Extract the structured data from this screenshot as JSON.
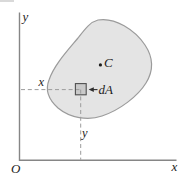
{
  "figure": {
    "axes": {
      "origin_label": "O",
      "x_axis_label": "x",
      "y_axis_label": "y"
    },
    "region": {
      "centroid_label": "C"
    },
    "element": {
      "label": "dA",
      "x_coordinate_label": "x",
      "y_coordinate_label": "y"
    }
  },
  "colors": {
    "region_fill": "#e4e4e4",
    "region_stroke": "#9b9b9b",
    "element_fill": "#c9c9c9",
    "element_stroke": "#4f4f4f",
    "axis_stroke": "#868686",
    "dash_stroke": "#9c9c9c",
    "arrow": "#2f2f2f",
    "artifact": "#d9d9d9"
  }
}
